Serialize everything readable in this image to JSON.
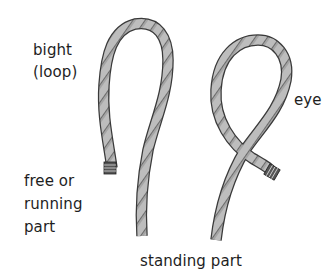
{
  "diagram": {
    "labels": {
      "bight": "bight",
      "loop": "(loop)",
      "eye": "eye",
      "free_line1": "free or",
      "free_line2": "running",
      "free_line3": "part",
      "standing": "standing part"
    },
    "colors": {
      "rope_fill": "#b9b9b9",
      "rope_dark": "#8f8f8f",
      "outline": "#3a3a3a",
      "text": "#1e1e1e"
    }
  }
}
